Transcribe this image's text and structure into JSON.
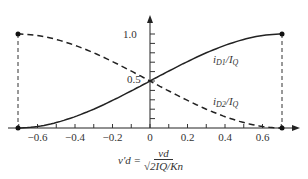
{
  "chart_data": {
    "type": "line",
    "title": "",
    "xlabel": "v_d' = v_d / sqrt(2 I_Q / K_n)",
    "ylabel": "",
    "xlim": [
      -0.78,
      0.8
    ],
    "ylim": [
      0,
      1.15
    ],
    "grid": false,
    "x_ticks": [
      -0.6,
      -0.4,
      -0.2,
      0,
      0.2,
      0.4,
      0.6
    ],
    "x_tick_labels": [
      "−0.6",
      "−0.4",
      "−0.2",
      "0",
      "0.2",
      "0.4",
      "0.6"
    ],
    "y_ticks": [
      0.1,
      0.2,
      0.3,
      0.4,
      0.5,
      0.6,
      0.7,
      0.8,
      0.9,
      1.0
    ],
    "y_tick_labels": {
      "0.5": "0.5",
      "1.0": "1.0"
    },
    "x": [
      -0.707,
      -0.6,
      -0.4,
      -0.2,
      0,
      0.2,
      0.4,
      0.6,
      0.707
    ],
    "series": [
      {
        "name": "iD1/IQ",
        "style": "solid",
        "values": [
          0,
          0.017,
          0.121,
          0.294,
          0.5,
          0.706,
          0.879,
          0.983,
          1.0
        ]
      },
      {
        "name": "iD2/IQ",
        "style": "dashed",
        "values": [
          1.0,
          0.983,
          0.879,
          0.706,
          0.5,
          0.294,
          0.121,
          0.017,
          0
        ]
      }
    ],
    "annotations": [
      {
        "text": "iD1/IQ",
        "near_x": 0.4,
        "near_y": 0.8
      },
      {
        "text": "iD2/IQ",
        "near_x": 0.45,
        "near_y": 0.3
      },
      {
        "text": "endpoint markers and dashed verticals at x = ±0.707"
      }
    ]
  },
  "labels": {
    "y_tick_1": "1.0",
    "y_tick_05": "0.5",
    "curve1_main": "i",
    "curve1_sub": "D1",
    "curve1_rest": "/I",
    "curve1_sub2": "Q",
    "curve2_main": "i",
    "curve2_sub": "D2",
    "curve2_rest": "/I",
    "curve2_sub2": "Q",
    "formula_lhs": "v′d =",
    "formula_num": "vd",
    "formula_den": "√2IQ/Kn"
  }
}
